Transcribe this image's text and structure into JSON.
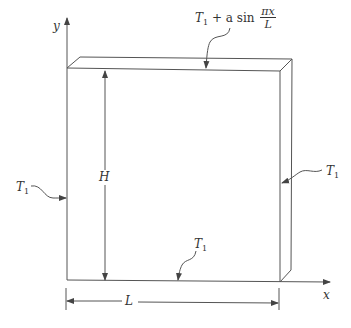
{
  "diagram": {
    "axes": {
      "x_label": "x",
      "y_label": "y"
    },
    "dimensions": {
      "height_label": "H",
      "length_label": "L"
    },
    "boundary_conditions": {
      "top": {
        "base": "T",
        "sub": "1",
        "rest": " + a sin ",
        "frac_num": "πx",
        "frac_den": "L"
      },
      "left": {
        "base": "T",
        "sub": "1"
      },
      "right": {
        "base": "T",
        "sub": "1"
      },
      "bottom": {
        "base": "T",
        "sub": "1"
      }
    },
    "colors": {
      "line": "#555555",
      "text": "#333333",
      "background": "#ffffff"
    }
  }
}
